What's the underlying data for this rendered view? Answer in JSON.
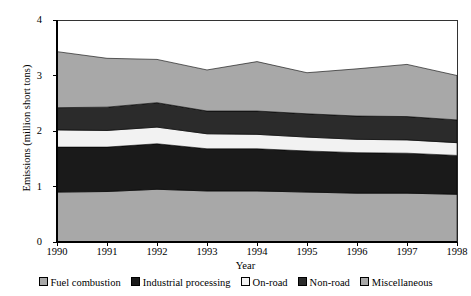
{
  "chart_data": {
    "type": "area",
    "stacked": true,
    "title": "",
    "xlabel": "Year",
    "ylabel": "Emissions (million short tons)",
    "categories": [
      1990,
      1991,
      1992,
      1993,
      1994,
      1995,
      1996,
      1997,
      1998
    ],
    "x_tick_labels": [
      "1990",
      "1991",
      "1992",
      "1993",
      "1994",
      "1995",
      "1996",
      "1997",
      "1998"
    ],
    "y_tick_labels": [
      "0",
      "1",
      "2",
      "3",
      "4"
    ],
    "y_ticks": [
      0,
      1,
      2,
      3,
      4
    ],
    "ylim": [
      0,
      4
    ],
    "xlim": [
      1990,
      1998
    ],
    "grid": false,
    "legend_position": "bottom",
    "series": [
      {
        "name": "Fuel combustion",
        "color": "#a8a8a8",
        "values": [
          0.9,
          0.91,
          0.95,
          0.92,
          0.92,
          0.9,
          0.88,
          0.88,
          0.86
        ]
      },
      {
        "name": "Industrial processing",
        "color": "#1a1a1a",
        "values": [
          0.81,
          0.8,
          0.82,
          0.76,
          0.76,
          0.74,
          0.73,
          0.72,
          0.7
        ]
      },
      {
        "name": "On-road",
        "color": "#f2f2f2",
        "values": [
          0.31,
          0.3,
          0.3,
          0.27,
          0.26,
          0.25,
          0.24,
          0.24,
          0.23
        ]
      },
      {
        "name": "Non-road",
        "color": "#2b2b2b",
        "values": [
          0.4,
          0.42,
          0.44,
          0.41,
          0.42,
          0.42,
          0.42,
          0.42,
          0.41
        ]
      },
      {
        "name": "Miscellaneous",
        "color": "#a8a8a8",
        "values": [
          1.01,
          0.88,
          0.78,
          0.74,
          0.89,
          0.74,
          0.85,
          0.94,
          0.8
        ]
      }
    ],
    "totals": [
      3.43,
      3.31,
      3.29,
      3.1,
      3.25,
      3.05,
      3.12,
      3.2,
      3.0
    ]
  },
  "legend": {
    "entries": [
      {
        "label": "Fuel combustion",
        "swatch": "gray-swatch"
      },
      {
        "label": "Industrial processing",
        "swatch": "black-swatch"
      },
      {
        "label": "On-road",
        "swatch": "white-swatch"
      },
      {
        "label": "Non-road",
        "swatch": "black-swatch"
      },
      {
        "label": "Miscellaneous",
        "swatch": "gray-swatch"
      }
    ]
  },
  "colors": {
    "axis": "#000000",
    "gray_band": "#a8a8a8",
    "black_band": "#1a1a1a",
    "dark_band": "#2b2b2b",
    "white_band": "#f2f2f2",
    "background": "#ffffff"
  }
}
